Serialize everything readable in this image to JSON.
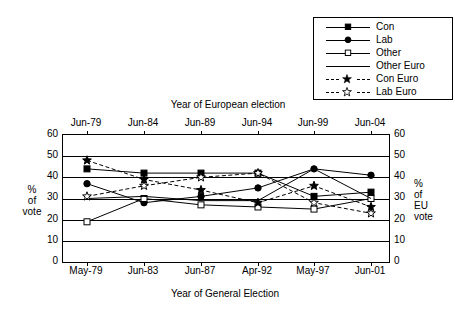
{
  "legend": {
    "items": [
      {
        "label": "Con",
        "marker": "filled-square",
        "line": "solid"
      },
      {
        "label": "Lab",
        "marker": "filled-circle",
        "line": "solid"
      },
      {
        "label": "Other",
        "marker": "open-square",
        "line": "solid"
      },
      {
        "label": "Other Euro",
        "marker": "none",
        "line": "solid"
      },
      {
        "label": "Con Euro",
        "marker": "filled-star",
        "line": "dashed"
      },
      {
        "label": "Lab Euro",
        "marker": "open-star",
        "line": "dashed"
      }
    ]
  },
  "axes": {
    "top_title": "Year of European election",
    "bottom_title": "Year of General Election",
    "left_title": "%\nof\nvote",
    "right_title": "%\nof\nEU\nvote",
    "top_ticks": [
      "Jun-79",
      "Jun-84",
      "Jun-89",
      "Jun-94",
      "Jun-99",
      "Jun-04"
    ],
    "bottom_ticks": [
      "May-79",
      "Jun-83",
      "Jun-87",
      "Apr-92",
      "May-97",
      "Jun-01"
    ],
    "y_ticks": [
      0,
      10,
      20,
      30,
      40,
      50,
      60
    ],
    "y_ticks_right": [
      0,
      10,
      20,
      30,
      40,
      50,
      60
    ]
  },
  "chart_data": {
    "type": "line",
    "title": "",
    "xlabel": "Year of General Election",
    "ylabel": "% of vote",
    "ylabel_right": "% of EU vote",
    "xlabel_top": "Year of European election",
    "ylim": [
      0,
      60
    ],
    "grid": true,
    "legend_position": "top-right",
    "categories": [
      "May-79",
      "Jun-83",
      "Jun-87",
      "Apr-92",
      "May-97",
      "Jun-01"
    ],
    "categories_top": [
      "Jun-79",
      "Jun-84",
      "Jun-89",
      "Jun-94",
      "Jun-99",
      "Jun-04"
    ],
    "series": [
      {
        "name": "Con",
        "values": [
          44,
          42,
          42,
          42,
          31,
          33
        ]
      },
      {
        "name": "Lab",
        "values": [
          37,
          28,
          31,
          35,
          44,
          41
        ]
      },
      {
        "name": "Other",
        "values": [
          19,
          30,
          27,
          26,
          25,
          30
        ]
      },
      {
        "name": "Other Euro",
        "values": [
          30,
          31,
          29,
          29,
          44,
          30
        ]
      },
      {
        "name": "Con Euro",
        "values": [
          48,
          39,
          34,
          28,
          36,
          26
        ]
      },
      {
        "name": "Lab Euro",
        "values": [
          31,
          36,
          40,
          42,
          28,
          23
        ]
      }
    ]
  }
}
